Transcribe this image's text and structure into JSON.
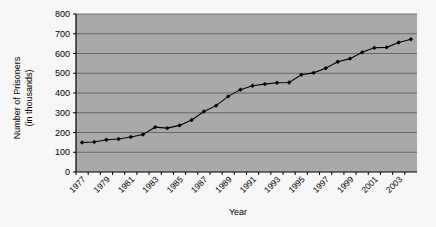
{
  "chart_data": {
    "type": "line",
    "title": "",
    "xlabel": "Year",
    "ylabel": "Number of Prisoners (in thousands)",
    "ylabel_line1": "Number of Prisoners",
    "ylabel_line2": "(in thousands)",
    "ylim": [
      0,
      800
    ],
    "ytick_step": 100,
    "yticks": [
      "0",
      "100",
      "200",
      "300",
      "400",
      "500",
      "600",
      "700",
      "800"
    ],
    "xticks_visible": [
      "1977",
      "1979",
      "1981",
      "1983",
      "1985",
      "1987",
      "1989",
      "1991",
      "1993",
      "1995",
      "1997",
      "1999",
      "2001",
      "2003"
    ],
    "xtick_all": [
      "1977",
      "1978",
      "1979",
      "1980",
      "1981",
      "1982",
      "1983",
      "1984",
      "1985",
      "1986",
      "1987",
      "1988",
      "1989",
      "1990",
      "1991",
      "1992",
      "1993",
      "1994",
      "1995",
      "1996",
      "1997",
      "1998",
      "1999",
      "2000",
      "2001",
      "2002",
      "2003",
      "2004"
    ],
    "x": [
      1977,
      1978,
      1979,
      1980,
      1981,
      1982,
      1983,
      1984,
      1985,
      1986,
      1987,
      1988,
      1989,
      1990,
      1991,
      1992,
      1993,
      1994,
      1995,
      1996,
      1997,
      1998,
      1999,
      2000,
      2001,
      2002,
      2003,
      2004
    ],
    "values": [
      149,
      152,
      163,
      167,
      177,
      190,
      227,
      222,
      236,
      263,
      306,
      336,
      383,
      417,
      437,
      445,
      452,
      453,
      492,
      502,
      525,
      558,
      574,
      606,
      629,
      631,
      656,
      672
    ],
    "grid": true,
    "legend": false,
    "marker": "diamond",
    "line_color": "#000000",
    "marker_color": "#000000",
    "plot_bg": "#a9a9a9",
    "grid_color": "#555555",
    "axis_color": "#000000",
    "page_bg": "#f7f7f7"
  }
}
